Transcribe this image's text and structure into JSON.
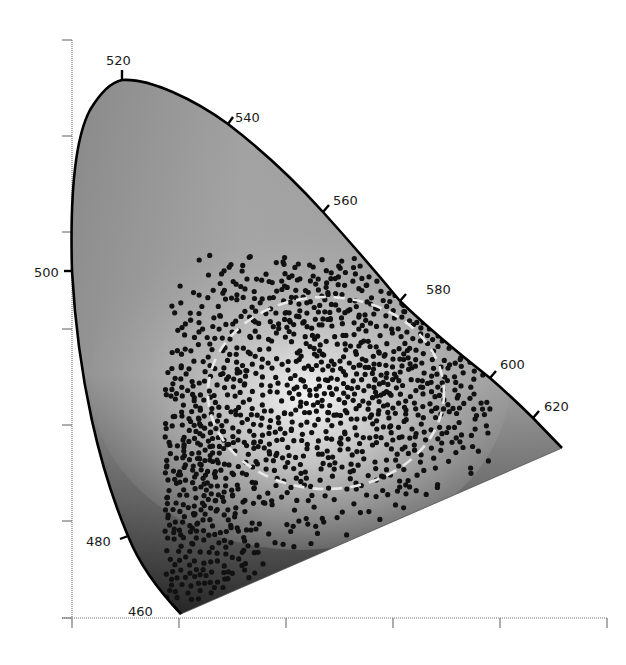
{
  "chart_data": {
    "type": "scatter",
    "title": "",
    "subtitle": "",
    "xlabel": "",
    "ylabel": "",
    "grid": false,
    "legend": null,
    "x_axis": {
      "ticks_px": [
        72,
        179,
        286,
        393,
        500,
        607
      ],
      "tick_labels": []
    },
    "y_axis": {
      "ticks_px": [
        40,
        136,
        232,
        329,
        425,
        521,
        618
      ],
      "tick_labels": []
    },
    "wavelength_labels": [
      {
        "label": "460",
        "unit": "nm",
        "tick": [
          [
            172,
            604
          ],
          [
            181,
            614
          ]
        ],
        "text_xy": [
          128,
          616
        ]
      },
      {
        "label": "480",
        "unit": "nm",
        "tick": [
          [
            120,
            539
          ],
          [
            128,
            536
          ]
        ],
        "text_xy": [
          86,
          546
        ]
      },
      {
        "label": "500",
        "unit": "nm",
        "tick": [
          [
            64,
            271
          ],
          [
            72,
            271
          ]
        ],
        "text_xy": [
          34,
          277
        ]
      },
      {
        "label": "520",
        "unit": "nm",
        "tick": [
          [
            122,
            70
          ],
          [
            122,
            80
          ]
        ],
        "text_xy": [
          106,
          65
        ]
      },
      {
        "label": "540",
        "unit": "nm",
        "tick": [
          [
            228,
            124
          ],
          [
            233,
            117
          ]
        ],
        "text_xy": [
          235,
          122
        ]
      },
      {
        "label": "560",
        "unit": "nm",
        "tick": [
          [
            323,
            212
          ],
          [
            329,
            205
          ]
        ],
        "text_xy": [
          333,
          205
        ]
      },
      {
        "label": "580",
        "unit": "nm",
        "tick": [
          [
            400,
            301
          ],
          [
            406,
            294
          ]
        ],
        "text_xy": [
          426,
          294
        ]
      },
      {
        "label": "600",
        "unit": "nm",
        "tick": [
          [
            490,
            378
          ],
          [
            496,
            371
          ]
        ],
        "text_xy": [
          500,
          369
        ]
      },
      {
        "label": "620",
        "unit": "nm",
        "tick": [
          [
            533,
            418
          ],
          [
            539,
            411
          ]
        ],
        "text_xy": [
          544,
          411
        ]
      }
    ],
    "spectral_locus_path": "M181,614 C160,592 140,566 128,536 C100,470 78,380 72,271 C70,200 74,140 90,110 C102,90 112,82 122,80 C150,78 195,100 228,124 C262,150 296,182 323,212 C350,242 376,272 400,301 C430,330 462,356 490,378 C506,392 520,405 533,418 L562,448 Z",
    "dashed_region": {
      "shape": "ellipse",
      "cx": 326,
      "cy": 393,
      "rx": 118,
      "ry": 96,
      "color": "#e8e8e8"
    },
    "scatter": {
      "approx_count": 1200,
      "dot_color": "#111111",
      "dot_radius": 2.6,
      "seed": 7,
      "clusters": [
        {
          "cx": 290,
          "cy": 400,
          "sx": 90,
          "sy": 70,
          "n": 620
        },
        {
          "cx": 410,
          "cy": 370,
          "sx": 55,
          "sy": 55,
          "n": 260
        },
        {
          "cx": 190,
          "cy": 530,
          "sx": 28,
          "sy": 60,
          "n": 230
        },
        {
          "cx": 300,
          "cy": 290,
          "sx": 45,
          "sy": 30,
          "n": 90
        }
      ],
      "bounds": {
        "xmin": 165,
        "xmax": 490,
        "ymin": 255,
        "ymax": 600
      }
    },
    "colors": {
      "locus_stroke": "#000000",
      "axis_stroke": "#777777",
      "fill_light": "#dcdcdc",
      "fill_mid": "#a8a8a8",
      "fill_dark": "#2a2a2a"
    }
  }
}
